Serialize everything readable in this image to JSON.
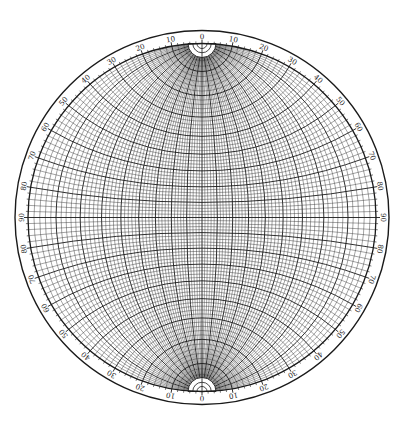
{
  "diagram": {
    "type": "wulff-stereonet",
    "center": [
      202,
      217.5
    ],
    "outer_radius": 187,
    "net_radius": 174,
    "minor_interval_deg": 2,
    "major_interval_deg": 10,
    "label_interval_deg": 10,
    "colors": {
      "background": "#ffffff",
      "line": "#1a1a1a",
      "minor_line": "#333333",
      "label": "#222222"
    },
    "rim_labels": {
      "top": [
        "0",
        "10",
        "20",
        "30",
        "40",
        "50",
        "60",
        "70",
        "80",
        "90"
      ],
      "description": "Each quadrant numbered 0 at N/S poles to 90 at E/W equator"
    },
    "pole_cap_radius": 14
  }
}
